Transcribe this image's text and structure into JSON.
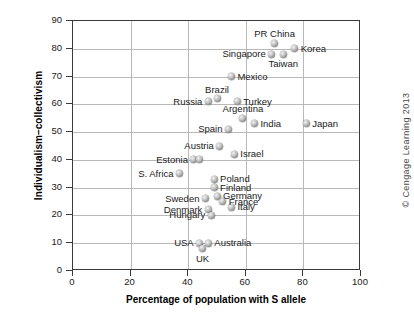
{
  "chart_data": {
    "type": "scatter",
    "title": "",
    "xlabel": "Percentage of population with S allele",
    "ylabel": "Individualism–collectivism",
    "xlim": [
      0,
      100
    ],
    "ylim": [
      0,
      90
    ],
    "xticks": [
      0,
      20,
      40,
      60,
      80,
      100
    ],
    "yticks": [
      0,
      10,
      20,
      30,
      40,
      50,
      60,
      70,
      80,
      90
    ],
    "grid": true,
    "legend": "none",
    "marker_style": "gray-sphere",
    "points": [
      {
        "label": "PR China",
        "x": 70,
        "y": 82,
        "label_pos": "above"
      },
      {
        "label": "Singapore",
        "x": 69,
        "y": 78,
        "label_pos": "left"
      },
      {
        "label": "Korea",
        "x": 77,
        "y": 80,
        "label_pos": "right"
      },
      {
        "label": "Taiwan",
        "x": 73,
        "y": 78,
        "label_pos": "below"
      },
      {
        "label": "Mexico",
        "x": 55,
        "y": 70,
        "label_pos": "right"
      },
      {
        "label": "Brazil",
        "x": 50,
        "y": 62,
        "label_pos": "above"
      },
      {
        "label": "Russia",
        "x": 47,
        "y": 61,
        "label_pos": "left"
      },
      {
        "label": "Turkey",
        "x": 57,
        "y": 61,
        "label_pos": "right"
      },
      {
        "label": "Argentina",
        "x": 59,
        "y": 55,
        "label_pos": "above"
      },
      {
        "label": "Spain",
        "x": 54,
        "y": 51,
        "label_pos": "left"
      },
      {
        "label": "India",
        "x": 63,
        "y": 53,
        "label_pos": "right"
      },
      {
        "label": "Japan",
        "x": 81,
        "y": 53,
        "label_pos": "right"
      },
      {
        "label": "Austria",
        "x": 51,
        "y": 45,
        "label_pos": "left"
      },
      {
        "label": "Israel",
        "x": 56,
        "y": 42,
        "label_pos": "right"
      },
      {
        "label": "Estonia",
        "x": 42,
        "y": 40,
        "label_pos": "left"
      },
      {
        "label": "",
        "x": 44,
        "y": 40,
        "label_pos": "none"
      },
      {
        "label": "S. Africa",
        "x": 37,
        "y": 35,
        "label_pos": "left"
      },
      {
        "label": "Poland",
        "x": 49,
        "y": 33,
        "label_pos": "right"
      },
      {
        "label": "Finland",
        "x": 49,
        "y": 30,
        "label_pos": "right"
      },
      {
        "label": "Germany",
        "x": 50,
        "y": 27,
        "label_pos": "right"
      },
      {
        "label": "France",
        "x": 52,
        "y": 25,
        "label_pos": "right"
      },
      {
        "label": "Italy",
        "x": 55,
        "y": 23,
        "label_pos": "right"
      },
      {
        "label": "Sweden",
        "x": 46,
        "y": 26,
        "label_pos": "left"
      },
      {
        "label": "Denmark",
        "x": 47,
        "y": 22,
        "label_pos": "left"
      },
      {
        "label": "Hungary",
        "x": 48,
        "y": 20,
        "label_pos": "left"
      },
      {
        "label": "USA",
        "x": 44,
        "y": 10,
        "label_pos": "left"
      },
      {
        "label": "Australia",
        "x": 47,
        "y": 10,
        "label_pos": "right"
      },
      {
        "label": "UK",
        "x": 45,
        "y": 8,
        "label_pos": "below"
      }
    ]
  },
  "credit": {
    "text": "© Cengage Learning 2013"
  },
  "colors": {
    "frame": "#3a3a3a",
    "grid": "#b9b9b9",
    "text": "#1a1a1a",
    "marker": "#8e8e8e",
    "background": "#ffffff"
  }
}
